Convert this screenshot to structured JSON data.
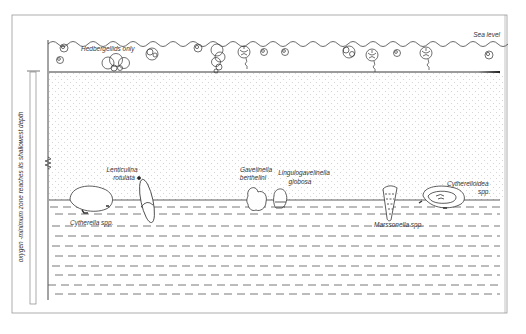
{
  "figure": {
    "type": "paleoecology-cross-section",
    "labels": {
      "sea_level": "Sea level",
      "hedbergellids": "Hedbergellids only",
      "omz_axis": "oxygen -minimum zone reaches its shallowest depth"
    },
    "taxa": [
      {
        "line1": "Lenticulina",
        "line2": "rotulata"
      },
      {
        "line1": "Cytherella spp.",
        "line2": ""
      },
      {
        "line1": "Gavelinella",
        "line2": "berthelini"
      },
      {
        "line1": "Lingulogavelinella",
        "line2": "globosa"
      },
      {
        "line1": "Marssonella spp.",
        "line2": ""
      },
      {
        "line1": "Cytherelloidea",
        "line2": "spp."
      }
    ],
    "colors": {
      "line": "#333333",
      "frame": "#9a9a9a",
      "dots": "#cfcfcf",
      "background": "#ffffff"
    }
  }
}
